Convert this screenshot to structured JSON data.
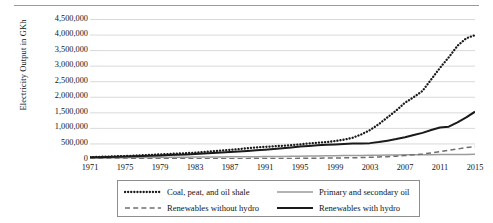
{
  "chart_data": {
    "type": "line",
    "title": "",
    "xlabel": "",
    "ylabel": "Electricity Output in GKh",
    "xlim": [
      1971,
      2015
    ],
    "ylim": [
      0,
      4500000
    ],
    "grid": true,
    "legend_position": "bottom",
    "ytick_labels": [
      "4,500,000",
      "4,000,000",
      "3,500,000",
      "3,000,000",
      "2,500,000",
      "2,000,000",
      "1,500,000",
      "1,000,000",
      "500,000",
      "0"
    ],
    "ytick_values": [
      4500000,
      4000000,
      3500000,
      3000000,
      2500000,
      2000000,
      1500000,
      1000000,
      500000,
      0
    ],
    "xtick_labels": [
      "1971",
      "1975",
      "1979",
      "1983",
      "1987",
      "1991",
      "1995",
      "1999",
      "2003",
      "2007",
      "2011",
      "2015"
    ],
    "xtick_values": [
      1971,
      1975,
      1979,
      1983,
      1987,
      1991,
      1995,
      1999,
      2003,
      2007,
      2011,
      2015
    ],
    "x": [
      1971,
      1972,
      1973,
      1974,
      1975,
      1976,
      1977,
      1978,
      1979,
      1980,
      1981,
      1982,
      1983,
      1984,
      1985,
      1986,
      1987,
      1988,
      1989,
      1990,
      1991,
      1992,
      1993,
      1994,
      1995,
      1996,
      1997,
      1998,
      1999,
      2000,
      2001,
      2002,
      2003,
      2004,
      2005,
      2006,
      2007,
      2008,
      2009,
      2010,
      2011,
      2012,
      2013,
      2014,
      2015
    ],
    "series": [
      {
        "name": "Coal, peat, and oil shale",
        "style": "dotted",
        "color": "#1a1a1a",
        "values": [
          60000,
          68000,
          78000,
          86000,
          95000,
          108000,
          120000,
          133000,
          147000,
          160000,
          175000,
          188000,
          205000,
          225000,
          248000,
          270000,
          295000,
          320000,
          345000,
          370000,
          390000,
          408000,
          425000,
          448000,
          470000,
          500000,
          520000,
          545000,
          575000,
          620000,
          680000,
          790000,
          930000,
          1120000,
          1340000,
          1560000,
          1810000,
          1990000,
          2190000,
          2560000,
          2930000,
          3270000,
          3640000,
          3880000,
          3980000
        ]
      },
      {
        "name": "Primary and secondary oil",
        "style": "solid-thin",
        "color": "#9b9b9b",
        "values": [
          30000,
          33000,
          36000,
          39000,
          42000,
          45000,
          48000,
          51000,
          54000,
          56000,
          58000,
          60000,
          62000,
          64000,
          66000,
          68000,
          70000,
          72000,
          74000,
          76000,
          78000,
          80000,
          83000,
          86000,
          90000,
          94000,
          98000,
          102000,
          106000,
          110000,
          113000,
          116000,
          120000,
          124000,
          128000,
          131000,
          134000,
          136000,
          138000,
          140000,
          142000,
          144000,
          146000,
          148000,
          150000
        ]
      },
      {
        "name": "Renewables without hydro",
        "style": "dashed",
        "color": "#6f6f6f",
        "values": [
          3000,
          3200,
          3400,
          3600,
          3900,
          4200,
          4600,
          5000,
          5400,
          5800,
          6300,
          6800,
          7400,
          8000,
          8700,
          9400,
          10200,
          11000,
          12000,
          13000,
          14000,
          15500,
          17000,
          19000,
          21000,
          23500,
          26000,
          29000,
          32000,
          36000,
          40000,
          46000,
          54000,
          64000,
          76000,
          92000,
          112000,
          136000,
          162000,
          196000,
          236000,
          280000,
          320000,
          365000,
          405000
        ]
      },
      {
        "name": "Renewables with hydro",
        "style": "solid-thick",
        "color": "#1a1a1a",
        "values": [
          55000,
          60000,
          66000,
          72000,
          80000,
          88000,
          97000,
          106000,
          116000,
          126000,
          137000,
          148000,
          160000,
          175000,
          190000,
          205000,
          222000,
          240000,
          260000,
          280000,
          300000,
          320000,
          345000,
          372000,
          400000,
          420000,
          440000,
          455000,
          470000,
          485000,
          495000,
          500000,
          510000,
          545000,
          590000,
          640000,
          700000,
          770000,
          840000,
          930000,
          1010000,
          1040000,
          1180000,
          1340000,
          1520000
        ]
      }
    ]
  },
  "legend": {
    "entries": [
      {
        "label": "Coal, peat, and oil shale",
        "style": "dotted"
      },
      {
        "label": "Primary and secondary oil",
        "style": "solid-thin"
      },
      {
        "label": "Renewables without hydro",
        "style": "dashed"
      },
      {
        "label": "Renewables with hydro",
        "style": "solid-thick"
      }
    ]
  },
  "colors": {
    "grid": "#c9c9c9",
    "axis": "#7d7d7d",
    "text": "#141414",
    "series_dark": "#1a1a1a",
    "series_gray": "#9b9b9b",
    "series_dash": "#6f6f6f"
  }
}
